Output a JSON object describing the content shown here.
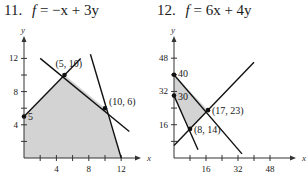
{
  "problems": [
    {
      "number": "11.",
      "lhs": "f",
      "rhs": "= −x + 3y"
    },
    {
      "number": "12.",
      "lhs": "f",
      "rhs": "= 6x + 4y"
    }
  ],
  "chart_data": [
    {
      "type": "line",
      "title": "11. f = −x + 3y",
      "xlabel": "x",
      "ylabel": "y",
      "xlim": [
        0,
        13.5
      ],
      "ylim": [
        0,
        13.5
      ],
      "xticks": [
        2,
        4,
        6,
        8,
        10,
        12
      ],
      "xtick_labels": [
        "",
        "4",
        "",
        "8",
        "",
        "12"
      ],
      "yticks": [
        2,
        4,
        6,
        8,
        10,
        12
      ],
      "ytick_labels": [
        "",
        "4",
        "",
        "8",
        "",
        "12"
      ],
      "feasible_region": [
        [
          0,
          0
        ],
        [
          0,
          5
        ],
        [
          5,
          10
        ],
        [
          10,
          6
        ],
        [
          12,
          0
        ]
      ],
      "lines": [
        {
          "from": [
            0,
            5
          ],
          "to": [
            7,
            12
          ]
        },
        {
          "from": [
            2,
            12
          ],
          "to": [
            13,
            3.2
          ]
        },
        {
          "from": [
            8.2,
            12.5
          ],
          "to": [
            12,
            0
          ]
        }
      ],
      "vertices": [
        {
          "x": 0,
          "y": 5,
          "label": "5"
        },
        {
          "x": 5,
          "y": 10,
          "label": "(5, 10)"
        },
        {
          "x": 10,
          "y": 6,
          "label": "(10, 6)"
        }
      ],
      "grid": false
    },
    {
      "type": "line",
      "title": "12. f = 6x + 4y",
      "xlabel": "x",
      "ylabel": "y",
      "xlim": [
        0,
        54
      ],
      "ylim": [
        0,
        54
      ],
      "xticks": [
        8,
        16,
        24,
        32,
        40,
        48
      ],
      "xtick_labels": [
        "",
        "16",
        "",
        "32",
        "",
        "48"
      ],
      "yticks": [
        8,
        16,
        24,
        32,
        40,
        48
      ],
      "ytick_labels": [
        "",
        "16",
        "",
        "32",
        "",
        "48"
      ],
      "feasible_region": [
        [
          0,
          40
        ],
        [
          0,
          30
        ],
        [
          8,
          14
        ],
        [
          17,
          23
        ]
      ],
      "lines": [
        {
          "from": [
            0,
            6
          ],
          "to": [
            40,
            46
          ]
        },
        {
          "from": [
            0,
            40
          ],
          "to": [
            34,
            2
          ]
        },
        {
          "from": [
            0,
            30
          ],
          "to": [
            12,
            4
          ]
        }
      ],
      "vertices": [
        {
          "x": 0,
          "y": 40,
          "label": "40"
        },
        {
          "x": 0,
          "y": 30,
          "label": "30"
        },
        {
          "x": 17,
          "y": 23,
          "label": "(17, 23)"
        },
        {
          "x": 8,
          "y": 14,
          "label": "(8, 14)"
        }
      ],
      "grid": false
    }
  ],
  "colors": {
    "region": "#d3d3d3",
    "line": "#111111",
    "axis": "#333333"
  }
}
